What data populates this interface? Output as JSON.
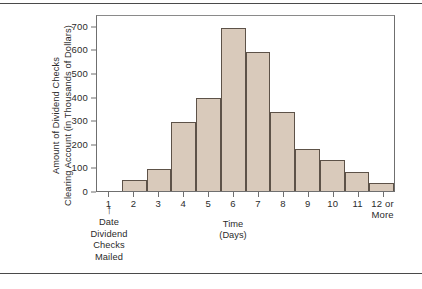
{
  "chart_data": {
    "type": "bar",
    "title": "",
    "subtitle": "",
    "xlabel": "Time (Days)",
    "ylabel": "Amount of Dividend Checks Clearing Account (in Thousands of Dollars)",
    "categories": [
      "1",
      "2",
      "3",
      "4",
      "5",
      "6",
      "7",
      "8",
      "9",
      "10",
      "11",
      "12 or More"
    ],
    "values": [
      0,
      45,
      95,
      293,
      395,
      690,
      590,
      335,
      180,
      132,
      82,
      32
    ],
    "ylim": [
      0,
      750
    ],
    "yticks": [
      0,
      100,
      200,
      300,
      400,
      500,
      600,
      700
    ],
    "ytick_labels": [
      "0",
      "100",
      "200",
      "300",
      "400",
      "500",
      "600",
      "700"
    ],
    "xtick_labels": [
      "1",
      "2",
      "3",
      "4",
      "5",
      "6",
      "7",
      "8",
      "9",
      "10",
      "11",
      "12 or More"
    ],
    "grid": false,
    "legend": null,
    "bar_fill_color": "#d9cabb",
    "bar_edge_color": "#5d5248",
    "axis_color": "#6f6f6f",
    "text_color": "#2b2b2b"
  },
  "axes": {
    "y_title_lines": [
      "Amount of Dividend Checks",
      "Clearing Account (in Thousands of Dollars)"
    ],
    "x_title_lines": [
      "Time",
      "(Days)"
    ],
    "x_labels": [
      {
        "lines": [
          "1"
        ]
      },
      {
        "lines": [
          "2"
        ]
      },
      {
        "lines": [
          "3"
        ]
      },
      {
        "lines": [
          "4"
        ]
      },
      {
        "lines": [
          "5"
        ]
      },
      {
        "lines": [
          "6"
        ]
      },
      {
        "lines": [
          "7"
        ]
      },
      {
        "lines": [
          "8"
        ]
      },
      {
        "lines": [
          "9"
        ]
      },
      {
        "lines": [
          "10"
        ]
      },
      {
        "lines": [
          "11"
        ]
      },
      {
        "lines": [
          "12 or",
          "More"
        ]
      }
    ],
    "y_labels": [
      "700",
      "600",
      "500",
      "400",
      "300",
      "200",
      "100",
      "0"
    ]
  },
  "annotation": {
    "arrow_glyph": "↑",
    "lines": [
      "Date",
      "Dividend",
      "Checks",
      "Mailed"
    ]
  }
}
